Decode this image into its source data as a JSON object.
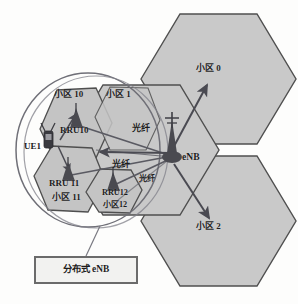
{
  "diagram": {
    "colors": {
      "background": "#fdfdfc",
      "hexagon_fill": "#c9c9c9",
      "hexagon_stroke": "#555555",
      "small_hexagon_fill": "#c4c4c4",
      "arrow": "#4a4a52",
      "fiber_line": "#5a5a62",
      "circle_stroke": "#6f6f77",
      "legend_border": "#6b6b6b",
      "legend_fill": "#f2f2f0",
      "text": "#1c1c1c",
      "tower_fill": "#4a4a50"
    },
    "macro_cells": [
      {
        "id": "cell0",
        "label": "小区 0",
        "x": 196,
        "y": 70
      },
      {
        "id": "cell2",
        "label": "小区 2",
        "x": 196,
        "y": 228
      }
    ],
    "distributed_cells": [
      {
        "id": "cell10",
        "label": "小区 10",
        "x": 57,
        "y": 95
      },
      {
        "id": "cell1",
        "label": "小区 1",
        "x": 107,
        "y": 95
      },
      {
        "id": "cell11",
        "label": "小区 11",
        "x": 57,
        "y": 198
      },
      {
        "id": "cell12",
        "label": "小区12",
        "x": 105,
        "y": 205
      }
    ],
    "rrus": [
      {
        "id": "rru10",
        "label": "RRU10",
        "x": 60,
        "y": 131
      },
      {
        "id": "rru11",
        "label": "RRU 11",
        "x": 51,
        "y": 183
      },
      {
        "id": "rru12",
        "label": "RRU12",
        "x": 103,
        "y": 193
      }
    ],
    "ue": {
      "id": "ue1",
      "label": "UE1",
      "x": 26,
      "y": 146
    },
    "enb": {
      "id": "enb",
      "label": "eNB",
      "x": 180,
      "y": 156
    },
    "fiber_links": [
      {
        "label": "光纤",
        "x": 135,
        "y": 128
      },
      {
        "label": "光纤",
        "x": 114,
        "y": 164
      },
      {
        "label": "光纤",
        "x": 140,
        "y": 178
      }
    ],
    "legend": {
      "label": "分布式 eNB"
    }
  }
}
